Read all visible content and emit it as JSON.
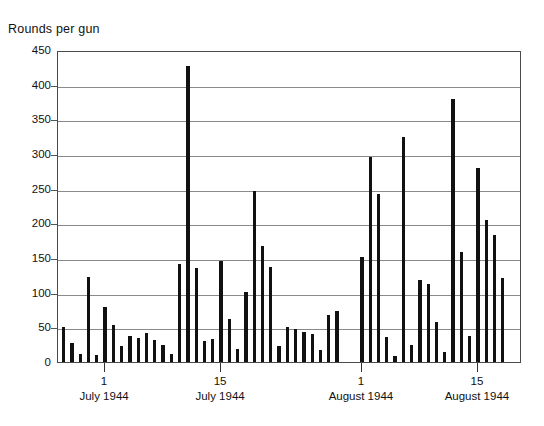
{
  "chart_data": {
    "type": "bar",
    "title": "",
    "ylabel": "Rounds per gun",
    "xlabel": "",
    "ylim": [
      0,
      450
    ],
    "ytick_labels": [
      "450",
      "400",
      "350",
      "300",
      "250",
      "200",
      "150",
      "100",
      "50",
      "0"
    ],
    "ytick_values": [
      450,
      400,
      350,
      300,
      250,
      200,
      150,
      100,
      50,
      0
    ],
    "grid": true,
    "legend": null,
    "bar_color": "#111111",
    "axis_color": "#4a4a4a",
    "gridline_color": "#8a8a8a",
    "x_axis_ticks": [
      {
        "day": "1",
        "month": "July 1944",
        "index": 5
      },
      {
        "day": "15",
        "month": "July 1944",
        "index": 19
      },
      {
        "day": "1",
        "month": "August 1944",
        "index": 36
      },
      {
        "day": "15",
        "month": "August 1944",
        "index": 50
      }
    ],
    "categories": [
      "Jun 26",
      "Jun 27",
      "Jun 28",
      "Jun 29",
      "Jun 30",
      "Jul 1",
      "Jul 2",
      "Jul 3",
      "Jul 4",
      "Jul 5",
      "Jul 6",
      "Jul 7",
      "Jul 8",
      "Jul 9",
      "Jul 10",
      "Jul 11",
      "Jul 12",
      "Jul 13",
      "Jul 14",
      "Jul 15",
      "Jul 16",
      "Jul 17",
      "Jul 18",
      "Jul 19",
      "Jul 20",
      "Jul 21",
      "Jul 22",
      "Jul 23",
      "Jul 24",
      "Jul 25",
      "Jul 26",
      "Jul 27",
      "Jul 28",
      "Jul 29",
      "Jul 30",
      "Jul 31",
      "Aug 1",
      "Aug 2",
      "Aug 3",
      "Aug 4",
      "Aug 5",
      "Aug 6",
      "Aug 7",
      "Aug 8",
      "Aug 9",
      "Aug 10",
      "Aug 11",
      "Aug 12",
      "Aug 13",
      "Aug 14",
      "Aug 15",
      "Aug 16",
      "Aug 17",
      "Aug 18",
      "Aug 19",
      "Aug 20"
    ],
    "values": [
      51,
      28,
      12,
      122,
      10,
      79,
      53,
      23,
      38,
      35,
      42,
      32,
      25,
      12,
      142,
      427,
      135,
      30,
      33,
      146,
      62,
      19,
      101,
      246,
      168,
      137,
      23,
      50,
      48,
      44,
      40,
      18,
      68,
      73,
      0,
      0,
      152,
      295,
      242,
      36,
      9,
      325,
      25,
      119,
      113,
      58,
      15,
      379,
      159,
      37,
      280,
      205,
      183,
      121,
      0,
      0
    ],
    "series_name": "Rounds per gun",
    "bar_count_drawn": 54,
    "n_categories": 56,
    "note_max": 427,
    "note_min": 9
  },
  "y_axis_title": "Rounds per gun"
}
